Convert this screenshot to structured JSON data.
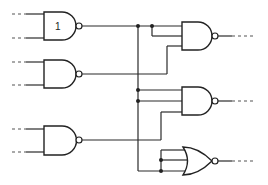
{
  "diagram": {
    "type": "logic-circuit",
    "gates": [
      {
        "id": "g1",
        "kind": "NAND",
        "label": "1",
        "inputs": 2
      },
      {
        "id": "g2",
        "kind": "NAND",
        "label": "",
        "inputs": 2
      },
      {
        "id": "g3",
        "kind": "NAND",
        "label": "",
        "inputs": 2
      },
      {
        "id": "g4",
        "kind": "NAND",
        "label": "",
        "inputs": 3
      },
      {
        "id": "g5",
        "kind": "NAND",
        "label": "",
        "inputs": 3
      },
      {
        "id": "g6",
        "kind": "NOR",
        "label": "",
        "inputs": 3
      }
    ],
    "connections": [
      "g1.out -> g4.in1, g4.in2, g5.in1, g5.in2, g6.in3",
      "g2.out -> g4.in3",
      "g3.out -> g5.in3, g6.in1, g6.in2"
    ],
    "colors": {
      "line": "#222222",
      "background": "#ffffff"
    }
  }
}
